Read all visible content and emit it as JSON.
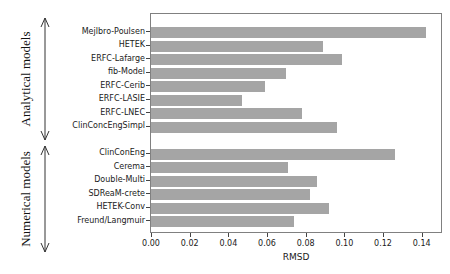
{
  "annotations": {
    "analytical_label": "Analytical models",
    "numerical_label": "Numerical models"
  },
  "colors": {
    "bar": "#a5a5a5",
    "spine": "#808080",
    "arrow": "#333333",
    "text": "#1a1a1a"
  },
  "chart_data": {
    "type": "bar",
    "orientation": "horizontal",
    "title": "",
    "xlabel": "RMSD",
    "ylabel": "",
    "xlim": [
      0,
      0.15
    ],
    "xticks": [
      "0.00",
      "0.02",
      "0.04",
      "0.06",
      "0.08",
      "0.10",
      "0.12",
      "0.14"
    ],
    "grid": false,
    "legend": "none",
    "bar_color": "#a5a5a5",
    "series": [
      {
        "name": "Analytical models",
        "categories": [
          "Mejlbro-Poulsen",
          "HETEK",
          "ERFC-Lafarge",
          "fib-Model",
          "ERFC-Cerib",
          "ERFC-LASIE",
          "ERFC-LNEC",
          "ClinConcEngSimpl"
        ],
        "values": [
          0.142,
          0.089,
          0.099,
          0.07,
          0.059,
          0.047,
          0.078,
          0.096
        ]
      },
      {
        "name": "Numerical models",
        "categories": [
          "ClinConEng",
          "Cerema",
          "Double-Multi",
          "SDReaM-crete",
          "HETEK-Conv",
          "Freund/Langmuir"
        ],
        "values": [
          0.126,
          0.071,
          0.086,
          0.082,
          0.092,
          0.074
        ]
      }
    ]
  }
}
